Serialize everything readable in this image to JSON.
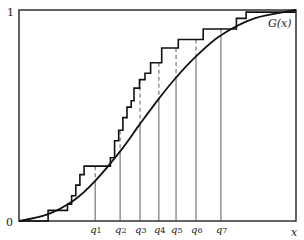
{
  "chart_data": {
    "type": "line",
    "title": "",
    "xlabel": "x",
    "ylabel": "",
    "ylim": [
      0,
      1
    ],
    "y_tick_labels": [
      "0",
      "1"
    ],
    "grid": false,
    "legend": null,
    "curve_label": "G(x)",
    "quantile_labels": [
      "q1",
      "q2",
      "q3",
      "q4",
      "q5",
      "q6",
      "q7"
    ],
    "quantile_positions_frac": [
      0.275,
      0.365,
      0.437,
      0.505,
      0.567,
      0.639,
      0.729
    ],
    "series": [
      {
        "name": "G(x)",
        "kind": "smooth-cdf",
        "points_frac": [
          [
            0.0,
            0.0
          ],
          [
            0.1,
            0.03
          ],
          [
            0.2,
            0.1
          ],
          [
            0.275,
            0.19
          ],
          [
            0.365,
            0.33
          ],
          [
            0.437,
            0.46
          ],
          [
            0.505,
            0.58
          ],
          [
            0.567,
            0.68
          ],
          [
            0.639,
            0.78
          ],
          [
            0.729,
            0.88
          ],
          [
            0.85,
            0.96
          ],
          [
            1.0,
            1.0
          ]
        ]
      },
      {
        "name": "empirical step function",
        "kind": "step",
        "steps_frac": [
          [
            0.0,
            0.0
          ],
          [
            0.105,
            0.0
          ],
          [
            0.105,
            0.05
          ],
          [
            0.175,
            0.05
          ],
          [
            0.175,
            0.08
          ],
          [
            0.19,
            0.08
          ],
          [
            0.19,
            0.12
          ],
          [
            0.205,
            0.12
          ],
          [
            0.205,
            0.17
          ],
          [
            0.22,
            0.17
          ],
          [
            0.22,
            0.22
          ],
          [
            0.235,
            0.22
          ],
          [
            0.235,
            0.26
          ],
          [
            0.33,
            0.26
          ],
          [
            0.33,
            0.3
          ],
          [
            0.345,
            0.3
          ],
          [
            0.345,
            0.38
          ],
          [
            0.36,
            0.38
          ],
          [
            0.36,
            0.43
          ],
          [
            0.375,
            0.43
          ],
          [
            0.375,
            0.49
          ],
          [
            0.39,
            0.49
          ],
          [
            0.39,
            0.54
          ],
          [
            0.405,
            0.54
          ],
          [
            0.405,
            0.57
          ],
          [
            0.415,
            0.57
          ],
          [
            0.415,
            0.63
          ],
          [
            0.435,
            0.63
          ],
          [
            0.435,
            0.67
          ],
          [
            0.455,
            0.67
          ],
          [
            0.455,
            0.7
          ],
          [
            0.475,
            0.7
          ],
          [
            0.475,
            0.75
          ],
          [
            0.515,
            0.75
          ],
          [
            0.515,
            0.82
          ],
          [
            0.575,
            0.82
          ],
          [
            0.575,
            0.86
          ],
          [
            0.665,
            0.86
          ],
          [
            0.665,
            0.91
          ],
          [
            0.785,
            0.91
          ],
          [
            0.785,
            0.96
          ],
          [
            0.82,
            0.96
          ],
          [
            0.82,
            0.99
          ],
          [
            1.0,
            0.99
          ]
        ]
      }
    ]
  },
  "labels": {
    "y_top": "1",
    "y_bottom": "0",
    "x_axis": "x",
    "curve": "G(x)",
    "q": [
      "q1",
      "q2",
      "q3",
      "q4",
      "q5",
      "q6",
      "q7"
    ]
  }
}
